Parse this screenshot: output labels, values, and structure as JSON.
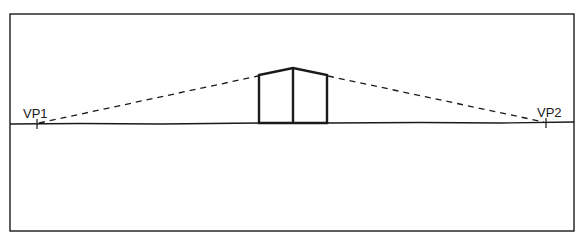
{
  "diagram": {
    "type": "two-point perspective",
    "colors": {
      "stroke": "#1a1a1a",
      "background": "#ffffff"
    },
    "frame": {
      "x1": 10,
      "y1": 14,
      "x2": 574,
      "y2": 231
    },
    "horizon": {
      "x1": 10,
      "y1": 124,
      "x2": 574,
      "y2": 122
    },
    "vanishing_points": [
      {
        "id": "vp1",
        "label": "VP1",
        "x": 37,
        "y": 124
      },
      {
        "id": "vp2",
        "label": "VP2",
        "x": 546,
        "y": 123
      }
    ],
    "box": {
      "apex": {
        "x": 293,
        "y": 68
      },
      "top_left": {
        "x": 259,
        "y": 75
      },
      "top_right": {
        "x": 327,
        "y": 75
      },
      "bottom_left": {
        "x": 259,
        "y": 123
      },
      "bottom_mid": {
        "x": 293,
        "y": 123
      },
      "bottom_right": {
        "x": 327,
        "y": 123
      }
    }
  }
}
